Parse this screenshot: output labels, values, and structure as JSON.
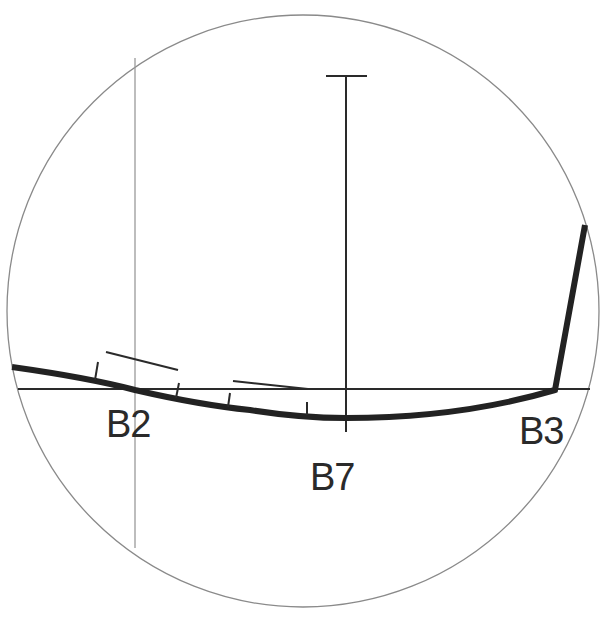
{
  "diagram": {
    "type": "detail-view-circle",
    "colors": {
      "background": "#ffffff",
      "circle_stroke": "#8a8a8a",
      "guide_stroke": "#9a9a9a",
      "line_stroke": "#2a2a2a",
      "curve_stroke": "#222222",
      "label_fill": "#2a2a2a"
    },
    "labels": [
      {
        "id": "B2",
        "text": "B2"
      },
      {
        "id": "B7",
        "text": "B7"
      },
      {
        "id": "B3",
        "text": "B3"
      }
    ]
  }
}
